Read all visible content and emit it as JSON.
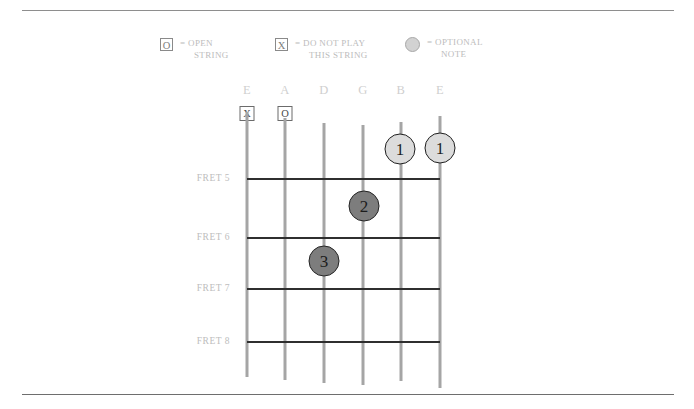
{
  "legend": {
    "open": {
      "symbol": "O",
      "line1": "= OPEN",
      "line2": "STRING"
    },
    "mute": {
      "symbol": "X",
      "line1": "= DO NOT PLAY",
      "line2": "THIS STRING"
    },
    "optional": {
      "symbol": "circle",
      "line1": "= OPTIONAL",
      "line2": "NOTE"
    }
  },
  "diagram": {
    "strings": [
      {
        "name": "E",
        "label": "E",
        "x": 247,
        "marker": "X",
        "top": 112,
        "bottom": 377
      },
      {
        "name": "A",
        "label": "A",
        "x": 285,
        "marker": "O",
        "top": 118,
        "bottom": 380
      },
      {
        "name": "D",
        "label": "D",
        "x": 324,
        "marker": "",
        "top": 123,
        "bottom": 383
      },
      {
        "name": "G",
        "label": "G",
        "x": 363,
        "marker": "",
        "top": 125,
        "bottom": 385
      },
      {
        "name": "B",
        "label": "B",
        "x": 401,
        "marker": "",
        "top": 122,
        "bottom": 381
      },
      {
        "name": "e",
        "label": "E",
        "x": 440,
        "marker": "",
        "top": 116,
        "bottom": 388
      }
    ],
    "frets": [
      {
        "label": "FRET 5",
        "y": 178
      },
      {
        "label": "FRET 6",
        "y": 237
      },
      {
        "label": "FRET 7",
        "y": 288
      },
      {
        "label": "FRET 8",
        "y": 341
      }
    ],
    "fingerings": [
      {
        "finger": "1",
        "string": "B",
        "x": 400,
        "y": 149,
        "style": "optional"
      },
      {
        "finger": "1",
        "string": "e",
        "x": 440,
        "y": 148,
        "style": "optional"
      },
      {
        "finger": "2",
        "string": "G",
        "x": 364,
        "y": 206,
        "style": "pressed"
      },
      {
        "finger": "3",
        "string": "D",
        "x": 324,
        "y": 261,
        "style": "pressed"
      }
    ]
  }
}
